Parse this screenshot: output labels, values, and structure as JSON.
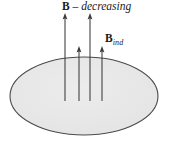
{
  "figure": {
    "title_label": {
      "symbol": "B",
      "separator": " – ",
      "word": "decreasing",
      "full_text": "B – decreasing"
    },
    "induced_label": {
      "symbol": "B",
      "subscript": "ind",
      "full_text": "Bind"
    },
    "colors": {
      "ellipse_fill": "#e8e8e8",
      "ellipse_stroke": "#4a4a4a",
      "arrow_stroke": "#3a3a3a",
      "text": "#1a1a1a",
      "background": "#ffffff"
    },
    "ellipse": {
      "center_x": 84,
      "center_y": 96,
      "radius_x": 74,
      "radius_y": 39,
      "stroke_width": 1.1
    },
    "arrows": [
      {
        "name": "field-arrow-1",
        "x": 65,
        "tip_y": 14,
        "tail_y": 101,
        "kind": "long"
      },
      {
        "name": "field-arrow-2",
        "x": 79,
        "tip_y": 47,
        "tail_y": 101,
        "kind": "short"
      },
      {
        "name": "field-arrow-3",
        "x": 90,
        "tip_y": 14,
        "tail_y": 101,
        "kind": "long"
      },
      {
        "name": "field-arrow-4",
        "x": 102,
        "tip_y": 47,
        "tail_y": 101,
        "kind": "short"
      }
    ],
    "arrow_direction": "up",
    "arrow_count": 4
  }
}
